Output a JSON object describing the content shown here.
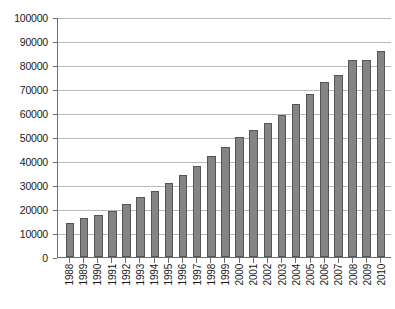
{
  "chart_data": {
    "type": "bar",
    "title": "",
    "subtitle": "",
    "xlabel": "",
    "ylabel": "",
    "categories": [
      "1988",
      "1989",
      "1990",
      "1991",
      "1992",
      "1993",
      "1994",
      "1995",
      "1996",
      "1997",
      "1998",
      "1999",
      "2000",
      "2001",
      "2002",
      "2003",
      "2004",
      "2005",
      "2006",
      "2007",
      "2008",
      "2009",
      "2010"
    ],
    "values": [
      14000,
      16200,
      17700,
      19300,
      22100,
      24800,
      27300,
      31000,
      34200,
      38000,
      42000,
      46000,
      50100,
      53000,
      56000,
      59300,
      63700,
      68000,
      72900,
      75700,
      82000,
      82000,
      85800
    ],
    "ylim": [
      0,
      100000
    ],
    "ytick_labels": [
      "0",
      "10000",
      "20000",
      "30000",
      "40000",
      "50000",
      "60000",
      "70000",
      "80000",
      "90000",
      "100000"
    ],
    "ytick_values": [
      0,
      10000,
      20000,
      30000,
      40000,
      50000,
      60000,
      70000,
      80000,
      90000,
      100000
    ],
    "grid": true,
    "legend": [],
    "legend_position": "none",
    "annotations": [],
    "colors": {
      "bar_fill": "#848484",
      "bar_border": "#555555",
      "gridline": "#b9b9b9",
      "axis": "#6e6e6e",
      "text": "#1a1a1a",
      "background": "#ffffff"
    }
  }
}
